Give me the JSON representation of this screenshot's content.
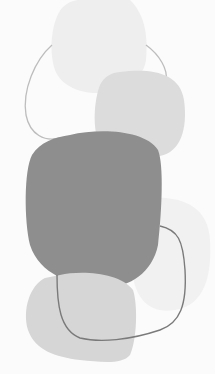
{
  "artwork": {
    "description": "Abstract composition of stacked organic rounded shapes in shades of grey with thin outline loops",
    "colors": {
      "background": "#fbfbfb",
      "top_blob": "#eeeeee",
      "mid_blob": "#dcdcdc",
      "dark_blob": "#8e8e8e",
      "right_faint_blob": "#f1f1f1",
      "bottom_blob": "#d6d6d6",
      "upper_outline": "#bdbdbd",
      "lower_outline": "#7a7a7a"
    }
  }
}
